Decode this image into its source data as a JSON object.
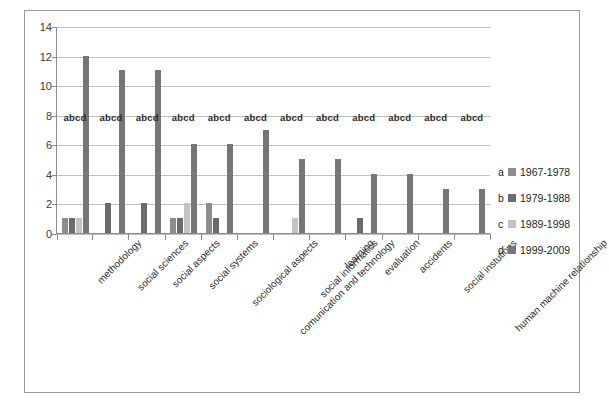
{
  "chart_data": {
    "type": "bar",
    "title": "",
    "xlabel": "",
    "ylabel": "",
    "ylim": [
      0,
      14
    ],
    "y_ticks": [
      0,
      2,
      4,
      6,
      8,
      10,
      12,
      14
    ],
    "grid": true,
    "legend_position": "right",
    "group_annotation": "abcd",
    "categories": [
      "methodology",
      "social sciences",
      "social aspects",
      "social systems",
      "sociological aspects",
      "comunication and technology",
      "social informatics",
      "learning",
      "evaluation",
      "accidents",
      "social instutions",
      "human machine relationship"
    ],
    "series": [
      {
        "key": "a",
        "name": "1967-1978",
        "color": "#8d8d8d",
        "values": [
          1,
          0,
          0,
          1,
          2,
          0,
          0,
          0,
          0,
          0,
          0,
          0
        ]
      },
      {
        "key": "b",
        "name": "1979-1988",
        "color": "#6b6b6b",
        "values": [
          1,
          2,
          2,
          1,
          1,
          0,
          0,
          0,
          1,
          0,
          0,
          0
        ]
      },
      {
        "key": "c",
        "name": "1989-1998",
        "color": "#c4c4c4",
        "values": [
          1,
          0,
          0,
          2,
          0,
          0,
          1,
          0,
          0,
          0,
          0,
          0
        ]
      },
      {
        "key": "d",
        "name": "1999-2009",
        "color": "#767676",
        "values": [
          12,
          11,
          11,
          6,
          6,
          7,
          5,
          5,
          4,
          4,
          3,
          3
        ]
      }
    ]
  },
  "legend": {
    "items": [
      {
        "key": "a",
        "label": "1967-1978",
        "color": "#8d8d8d"
      },
      {
        "key": "b",
        "label": "1979-1988",
        "color": "#6b6b6b"
      },
      {
        "key": "c",
        "label": "1989-1998",
        "color": "#c4c4c4"
      },
      {
        "key": "d",
        "label": "1999-2009",
        "color": "#767676"
      }
    ]
  }
}
